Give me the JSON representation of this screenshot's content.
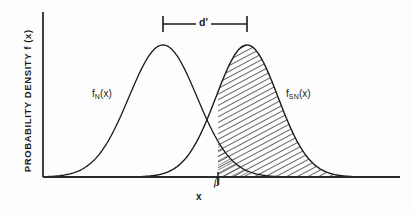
{
  "figure": {
    "axis_y_title_prefix": "PROBABILITY DENSITY f (x)",
    "axis_x_title": "x"
  },
  "labels": {
    "dprime": "d'",
    "curve_noise_base": "f",
    "curve_noise_sub": "N",
    "curve_noise_arg": "(x)",
    "curve_signal_base": "f",
    "curve_signal_sub": "SN",
    "curve_signal_arg": "(x)",
    "criterion": "β"
  },
  "colors": {
    "ink": "#1a1a1a",
    "axis": "#2a2a2a",
    "hatch": "#333333",
    "background": "#fdfdfd"
  },
  "chart_data": {
    "type": "line",
    "title": "",
    "xlabel": "x",
    "ylabel": "PROBABILITY DENSITY f (x)",
    "grid": false,
    "legend_position": "inline-curve-labels",
    "axis_origin_px": [
      43,
      177
    ],
    "axis_x_end_px": 400,
    "axis_y_top_px": 12,
    "series": [
      {
        "name": "f_N(x)",
        "distribution": "gaussian",
        "mean_px": 163,
        "sigma_px": 34,
        "peak_px": [
          163,
          45
        ],
        "amplitude_px": 132,
        "shaded": false,
        "label": "f_N (x)",
        "label_px": [
          92,
          89
        ]
      },
      {
        "name": "f_SN(x)",
        "distribution": "gaussian",
        "mean_px": 247,
        "sigma_px": 31,
        "peak_px": [
          247,
          45
        ],
        "amplitude_px": 132,
        "shaded": true,
        "shading": "diagonal-hatch",
        "label": "f_SN (x)",
        "label_px": [
          286,
          89
        ]
      }
    ],
    "annotations": [
      {
        "kind": "span-bracket",
        "label": "d'",
        "from_px": 163,
        "to_px": 247,
        "y_px": 24,
        "tick_half_height_px": 8,
        "meaning": "separation between the two distribution means"
      },
      {
        "kind": "criterion-tick",
        "label": "β",
        "x_px": 218,
        "y_px": 177,
        "tick_length_px": 8,
        "meaning": "decision criterion on the x axis; hatched area lies to its right"
      },
      {
        "kind": "curve-intersection",
        "x_px": 205,
        "y_px": 133
      }
    ],
    "shaded_region": {
      "series": "f_SN(x)",
      "from_x_px": 218,
      "to_x_px": 400,
      "pattern": "diagonal-hatch",
      "note": "also a small hatched sliver under f_N(x) just right of beta near the baseline"
    }
  }
}
